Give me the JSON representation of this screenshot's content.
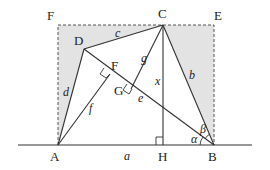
{
  "diagram": {
    "type": "geometry",
    "points": {
      "F_corner": {
        "label": "F",
        "x": 58,
        "y": 25
      },
      "C": {
        "label": "C",
        "x": 163,
        "y": 25
      },
      "E": {
        "label": "E",
        "x": 214,
        "y": 25
      },
      "D": {
        "label": "D",
        "x": 84,
        "y": 49
      },
      "A": {
        "label": "A",
        "x": 58,
        "y": 145
      },
      "H": {
        "label": "H",
        "x": 164,
        "y": 145
      },
      "B": {
        "label": "B",
        "x": 214,
        "y": 145
      },
      "F_foot": {
        "label": "F",
        "x": 112,
        "y": 75
      },
      "G": {
        "label": "G",
        "x": 135,
        "y": 91
      }
    },
    "point_labels": {
      "F_top": "F",
      "C": "C",
      "E": "E",
      "D": "D",
      "F_mid": "F",
      "G": "G",
      "A": "A",
      "H": "H",
      "B": "B"
    },
    "segment_labels": {
      "a": "a",
      "b": "b",
      "c": "c",
      "d": "d",
      "e": "e",
      "f": "f",
      "g": "g",
      "x": "x"
    },
    "angle_labels": {
      "alpha": "α",
      "beta": "β"
    },
    "colors": {
      "line": "#333333",
      "shade": "#e3e3e3",
      "dash": "#555555"
    }
  }
}
